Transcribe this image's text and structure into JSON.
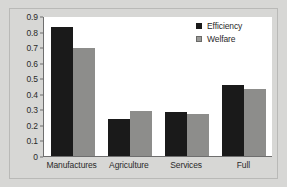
{
  "chart_data": {
    "type": "bar",
    "title": "",
    "xlabel": "",
    "ylabel": "",
    "categories": [
      "Manufactures",
      "Agriculture",
      "Services",
      "Full"
    ],
    "series": [
      {
        "name": "Efficiency",
        "color": "#1a1a1a",
        "values": [
          0.83,
          0.235,
          0.285,
          0.455
        ]
      },
      {
        "name": "Welfare",
        "color": "#8d8d8b",
        "values": [
          0.695,
          0.29,
          0.272,
          0.428
        ]
      }
    ],
    "ylim": [
      0,
      0.9
    ],
    "ytick_values": [
      0,
      0.1,
      0.2,
      0.3,
      0.4,
      0.5,
      0.6,
      0.7,
      0.8,
      0.9
    ],
    "ytick_labels": [
      "0",
      "0.1",
      "0.2",
      "0.3",
      "0.4",
      "0.5",
      "0.6",
      "0.7",
      "0.8",
      "0.9"
    ],
    "grid": false,
    "legend_position": "top-right",
    "background_color": "#d7d7d5",
    "plot_background_color": "#ffffff",
    "axis_color": "#6e6e6e"
  }
}
